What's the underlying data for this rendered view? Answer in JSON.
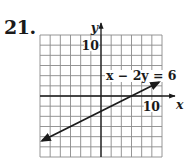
{
  "problem": {
    "number": "21."
  },
  "chart_data": {
    "type": "line",
    "title": "",
    "equation": "x − 2y = 6",
    "xlabel": "x",
    "ylabel": "y",
    "xlim": [
      -12,
      12
    ],
    "ylim": [
      -12,
      12
    ],
    "grid": true,
    "grid_step": 2,
    "tick_labels": {
      "x": [
        "10"
      ],
      "y": [
        "10"
      ]
    },
    "series": [
      {
        "name": "x − 2y = 6",
        "slope": 0.5,
        "intercept": -3,
        "x": [
          -11.6,
          11.4
        ],
        "y": [
          -8.8,
          2.7
        ],
        "arrows": "both"
      }
    ],
    "colors": {
      "line": "#1a1a1a",
      "grid": "#8a8a8a",
      "axis": "#1a1a1a"
    }
  }
}
